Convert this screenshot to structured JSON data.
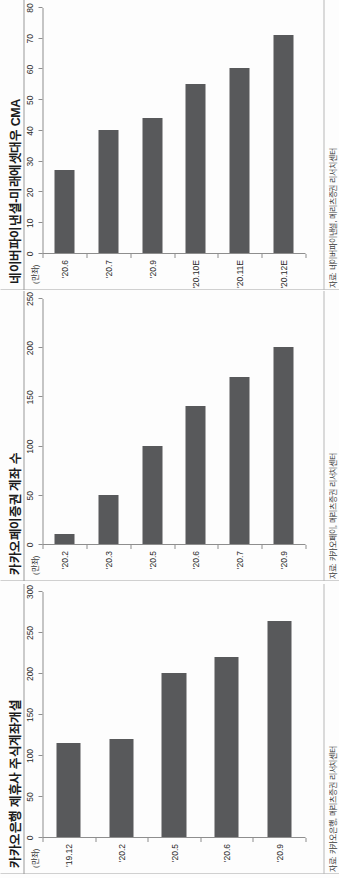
{
  "page": {
    "background": "#ffffff",
    "bar_color": "#58595b",
    "axis_color": "#8e8e8e"
  },
  "charts": [
    {
      "title": "네이버파이낸셜-미래에셋대우 CMA",
      "unit": "(만좌)",
      "source": "자료: 네이버파이낸셜, 메리츠증권 리서치센터",
      "chart_data": {
        "type": "bar",
        "orientation": "horizontal",
        "title": "네이버파이낸셜-미래에셋대우 CMA",
        "xlabel": "",
        "ylabel": "(만좌)",
        "categories": [
          "'20.6",
          "'20.7",
          "'20.9",
          "'20.10E",
          "'20.11E",
          "'20.12E"
        ],
        "values": [
          27,
          40,
          44,
          55,
          60,
          71
        ],
        "ylim": [
          0,
          80
        ],
        "yticks": [
          0,
          10,
          20,
          30,
          40,
          50,
          60,
          70,
          80
        ],
        "grid": false,
        "legend": "none"
      }
    },
    {
      "title": "카카오페이증권 계좌 수",
      "unit": "(만좌)",
      "source": "자료: 카카오페이, 메리츠증권 리서치센터",
      "chart_data": {
        "type": "bar",
        "orientation": "horizontal",
        "title": "카카오페이증권 계좌 수",
        "xlabel": "",
        "ylabel": "(만좌)",
        "categories": [
          "'20.2",
          "'20.3",
          "'20.5",
          "'20.6",
          "'20.7",
          "'20.9"
        ],
        "values": [
          10,
          50,
          100,
          140,
          170,
          200
        ],
        "ylim": [
          0,
          250
        ],
        "yticks": [
          0,
          50,
          100,
          150,
          200,
          250
        ],
        "grid": false,
        "legend": "none"
      }
    },
    {
      "title": "카카오은행 제휴사 주식계좌개설",
      "unit": "(만좌)",
      "source": "자료: 카카오은행, 메리츠증권 리서치센터",
      "chart_data": {
        "type": "bar",
        "orientation": "horizontal",
        "title": "카카오은행 제휴사 주식계좌개설",
        "xlabel": "",
        "ylabel": "(만좌)",
        "categories": [
          "'19.12",
          "'20.2",
          "'20.5",
          "'20.6",
          "'20.9"
        ],
        "values": [
          115,
          120,
          200,
          220,
          263
        ],
        "ylim": [
          0,
          300
        ],
        "yticks": [
          0,
          50,
          100,
          150,
          200,
          250,
          300
        ],
        "grid": false,
        "legend": "none"
      }
    }
  ]
}
